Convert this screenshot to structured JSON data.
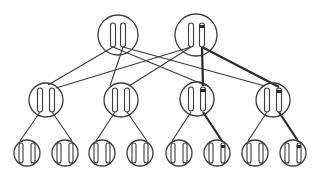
{
  "diagram": {
    "title": "",
    "colors": {
      "stroke": "#3a3a3a",
      "bold": "#2a2a2a",
      "background": "#ffffff"
    },
    "levels": [
      {
        "name": "top",
        "nodes": [
          {
            "id": "t1",
            "cx": 118,
            "cy": 35,
            "r": 20,
            "rods": [
              {
                "x": 113,
                "marked": false
              },
              {
                "x": 123,
                "marked": false
              }
            ]
          },
          {
            "id": "t2",
            "cx": 196,
            "cy": 35,
            "r": 21,
            "rods": [
              {
                "x": 191,
                "marked": false
              },
              {
                "x": 202,
                "marked": true
              }
            ]
          }
        ]
      },
      {
        "name": "middle",
        "nodes": [
          {
            "id": "m1",
            "cx": 46,
            "cy": 100,
            "r": 17,
            "rods": [
              {
                "x": 40,
                "marked": false
              },
              {
                "x": 52,
                "marked": false
              }
            ]
          },
          {
            "id": "m2",
            "cx": 121,
            "cy": 100,
            "r": 17,
            "rods": [
              {
                "x": 115,
                "marked": false
              },
              {
                "x": 127,
                "marked": false
              }
            ]
          },
          {
            "id": "m3",
            "cx": 197,
            "cy": 99,
            "r": 17,
            "rods": [
              {
                "x": 191,
                "marked": false
              },
              {
                "x": 203,
                "marked": true
              }
            ]
          },
          {
            "id": "m4",
            "cx": 273,
            "cy": 100,
            "r": 17,
            "rods": [
              {
                "x": 267,
                "marked": false
              },
              {
                "x": 279,
                "marked": true
              }
            ]
          }
        ]
      },
      {
        "name": "bottom",
        "nodes": [
          {
            "id": "b1",
            "cx": 27,
            "cy": 153,
            "r": 13,
            "marked": false
          },
          {
            "id": "b2",
            "cx": 65,
            "cy": 153,
            "r": 13,
            "marked": false
          },
          {
            "id": "b3",
            "cx": 102,
            "cy": 153,
            "r": 13,
            "marked": false
          },
          {
            "id": "b4",
            "cx": 140,
            "cy": 153,
            "r": 13,
            "marked": false
          },
          {
            "id": "b5",
            "cx": 179,
            "cy": 153,
            "r": 13,
            "marked": false
          },
          {
            "id": "b6",
            "cx": 217,
            "cy": 153,
            "r": 13,
            "marked": true
          },
          {
            "id": "b7",
            "cx": 255,
            "cy": 153,
            "r": 13,
            "marked": false
          },
          {
            "id": "b8",
            "cx": 293,
            "cy": 153,
            "r": 13,
            "marked": true
          }
        ]
      }
    ],
    "edges": [
      {
        "from": [
          113,
          47
        ],
        "to": [
          48,
          85
        ],
        "bold": false
      },
      {
        "from": [
          113,
          47
        ],
        "to": [
          207,
          86
        ],
        "bold": false
      },
      {
        "from": [
          123,
          47
        ],
        "to": [
          110,
          86
        ],
        "bold": false
      },
      {
        "from": [
          123,
          47
        ],
        "to": [
          265,
          86
        ],
        "bold": false
      },
      {
        "from": [
          191,
          47
        ],
        "to": [
          56,
          88
        ],
        "bold": false
      },
      {
        "from": [
          191,
          47
        ],
        "to": [
          129,
          86
        ],
        "bold": false
      },
      {
        "from": [
          202,
          47
        ],
        "to": [
          203,
          86
        ],
        "bold": true
      },
      {
        "from": [
          202,
          47
        ],
        "to": [
          279,
          87
        ],
        "bold": true
      },
      {
        "from": [
          40,
          112
        ],
        "to": [
          20,
          141
        ],
        "bold": false
      },
      {
        "from": [
          52,
          112
        ],
        "to": [
          72,
          141
        ],
        "bold": false
      },
      {
        "from": [
          115,
          112
        ],
        "to": [
          96,
          141
        ],
        "bold": false
      },
      {
        "from": [
          127,
          112
        ],
        "to": [
          147,
          141
        ],
        "bold": false
      },
      {
        "from": [
          191,
          112
        ],
        "to": [
          172,
          141
        ],
        "bold": false
      },
      {
        "from": [
          203,
          112
        ],
        "to": [
          222,
          141
        ],
        "bold": true
      },
      {
        "from": [
          267,
          112
        ],
        "to": [
          248,
          141
        ],
        "bold": false
      },
      {
        "from": [
          279,
          112
        ],
        "to": [
          298,
          141
        ],
        "bold": true
      }
    ]
  }
}
